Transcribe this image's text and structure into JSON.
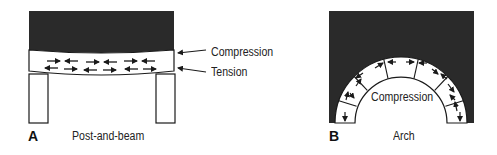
{
  "figure": {
    "panels": [
      {
        "id": "A",
        "letter": "A",
        "caption": "Post-and-beam",
        "callouts": [
          "Compression",
          "Tension"
        ]
      },
      {
        "id": "B",
        "letter": "B",
        "caption": "Arch",
        "center_label": "Compression"
      }
    ]
  },
  "colors": {
    "mass": "#2a2a2a",
    "stroke": "#1a1a1a",
    "background": "#ffffff"
  }
}
